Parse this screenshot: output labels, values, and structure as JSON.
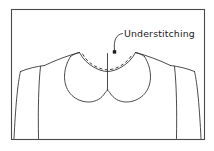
{
  "figure": {
    "title": "Understitching",
    "background_color": "#ffffff",
    "frame": {
      "stroke_color": "#4a4a4a",
      "x": 11,
      "y": 9,
      "width": 194,
      "height": 131
    },
    "annotation": {
      "label": "Understitching",
      "text_x": 124,
      "text_y": 37,
      "text_color": "#1a1a1a",
      "leader_color": "#2b2b2b"
    },
    "stitch_line": {
      "name": "understitching-dashes",
      "style": "dashed",
      "color": "#2b2b2b"
    },
    "garment": {
      "line_color": "#2b2b2b",
      "parts": [
        "left-shoulder",
        "right-shoulder",
        "left-armhole",
        "right-armhole",
        "left-side-seam",
        "right-side-seam",
        "neckline",
        "left-collar",
        "right-collar",
        "center-front-seam",
        "hem"
      ]
    }
  }
}
